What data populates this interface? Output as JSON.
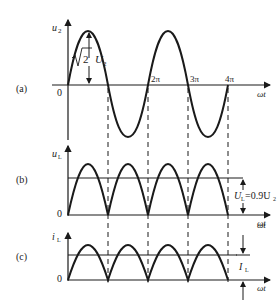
{
  "diagram": {
    "type": "full-wave rectifier waveforms",
    "panels": [
      {
        "id": "a",
        "label": "(a)",
        "y_axis_label": "u",
        "y_axis_sub": "2",
        "x_axis_label": "ωt",
        "origin_label": "0",
        "tick_labels": [
          "2π",
          "3π",
          "4π"
        ],
        "amplitude_label_root": "2",
        "amplitude_label_var": "U",
        "amplitude_label_sub": "2"
      },
      {
        "id": "b",
        "label": "(b)",
        "y_axis_label": "u",
        "y_axis_sub": "L",
        "x_axis_label": "ωt",
        "origin_label": "0",
        "avg_label_var": "U",
        "avg_label_sub": "L",
        "avg_label_eq": "=0.9U",
        "avg_label_eq_sub": "2"
      },
      {
        "id": "c",
        "label": "(c)",
        "y_axis_label": "i",
        "y_axis_sub": "L",
        "x_axis_label": "ωt",
        "origin_label": "0",
        "avg_label_var": "I",
        "avg_label_sub": "L"
      }
    ],
    "colors": {
      "stroke": "#1a1a1a",
      "text": "#222222"
    }
  }
}
